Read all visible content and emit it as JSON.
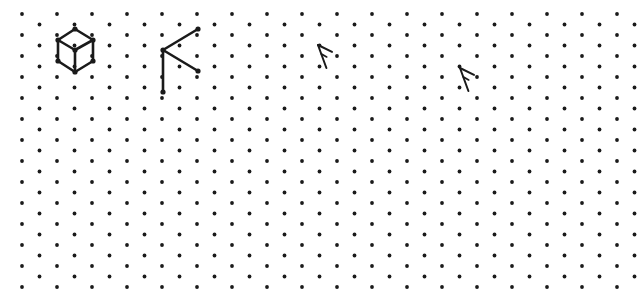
{
  "canvas": {
    "name": "isometric-dot-paper",
    "width": 642,
    "height": 305,
    "background_color": "#ffffff",
    "ink_color": "#1a1a1a"
  },
  "grid": {
    "type": "isometric-dot-lattice",
    "dot_color": "#1a1a1a",
    "dot_radius": 1.9,
    "origin_x": 22,
    "origin_y": 14,
    "column_spacing": 35,
    "row_spacing": 10.5,
    "row_offset": 17.5,
    "columns": 18,
    "rows": 27
  },
  "drawings": [
    {
      "name": "isometric-cube",
      "label": "Cube",
      "stroke_color": "#1a1a1a",
      "stroke_width": 2.6,
      "vertices": {
        "top": [
          75,
          29
        ],
        "upper_left": [
          58,
          40
        ],
        "upper_right": [
          93,
          40
        ],
        "center": [
          75,
          50
        ],
        "lower_left": [
          58,
          61
        ],
        "lower_right": [
          93,
          61
        ],
        "bottom": [
          75,
          72
        ]
      },
      "edges": [
        [
          75,
          29,
          58,
          40
        ],
        [
          58,
          40,
          58,
          61
        ],
        [
          58,
          61,
          75,
          72
        ],
        [
          75,
          72,
          93,
          61
        ],
        [
          93,
          61,
          93,
          40
        ],
        [
          93,
          40,
          75,
          29
        ],
        [
          75,
          50,
          58,
          40
        ],
        [
          75,
          50,
          93,
          40
        ],
        [
          75,
          50,
          75,
          72
        ]
      ]
    },
    {
      "name": "partial-cube-sketch",
      "label": "Partial cube",
      "stroke_color": "#1a1a1a",
      "stroke_width": 2.6,
      "vertices": {
        "apex": [
          163,
          50
        ],
        "upper_end": [
          198,
          29
        ],
        "lower_end": [
          198,
          71
        ],
        "vertical_end": [
          163,
          92
        ]
      },
      "edges": [
        [
          163,
          50,
          198,
          29
        ],
        [
          163,
          50,
          198,
          71
        ],
        [
          163,
          50,
          163,
          92
        ]
      ]
    }
  ],
  "cursor_marks": [
    {
      "name": "cursor-caret-1",
      "label": "Pointer",
      "x": 318,
      "y": 45,
      "width": 14,
      "height": 23,
      "stroke_color": "#1a1a1a",
      "stroke_width": 2.0
    },
    {
      "name": "cursor-caret-2",
      "label": "Pointer",
      "x": 460,
      "y": 68,
      "width": 14,
      "height": 23,
      "stroke_color": "#1a1a1a",
      "stroke_width": 2.0
    }
  ]
}
